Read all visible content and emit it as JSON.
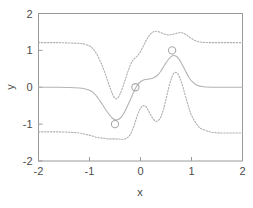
{
  "chart_data": {
    "type": "line",
    "title": "",
    "subtitle": "",
    "xlabel": "x",
    "ylabel": "y",
    "xlim": [
      -2,
      2
    ],
    "ylim": [
      -2,
      2
    ],
    "xticks": [
      -2,
      -1,
      0,
      1,
      2
    ],
    "yticks": [
      -2,
      -1,
      0,
      1,
      2
    ],
    "xtick_labels": [
      "-2",
      "-1",
      "0",
      "1",
      "2"
    ],
    "ytick_labels": [
      "-2",
      "-1",
      "0",
      "1",
      "2"
    ],
    "grid": false,
    "legend": "none",
    "colors": {
      "mean": "#b4b4b4",
      "band": "#b0b0b0",
      "marker": "#a8a8a8",
      "frame": "#9a9a9a",
      "text": "#4d4d4d",
      "background": "#ffffff"
    },
    "observations": {
      "name": "observed data points",
      "marker": "open-circle",
      "x": [
        -0.5,
        -0.1,
        0.62
      ],
      "y": [
        -1.0,
        0.0,
        1.0
      ]
    },
    "series": [
      {
        "name": "predictive mean",
        "style": "solid",
        "x": [
          -2.0,
          -1.8,
          -1.6,
          -1.4,
          -1.2,
          -1.1,
          -1.0,
          -0.95,
          -0.9,
          -0.85,
          -0.8,
          -0.75,
          -0.7,
          -0.65,
          -0.6,
          -0.55,
          -0.5,
          -0.45,
          -0.4,
          -0.35,
          -0.3,
          -0.25,
          -0.2,
          -0.15,
          -0.1,
          -0.05,
          0.0,
          0.05,
          0.1,
          0.15,
          0.2,
          0.25,
          0.3,
          0.35,
          0.4,
          0.45,
          0.5,
          0.55,
          0.6,
          0.65,
          0.7,
          0.75,
          0.8,
          0.85,
          0.9,
          0.95,
          1.0,
          1.1,
          1.2,
          1.4,
          1.6,
          1.8,
          2.0
        ],
        "y": [
          0.0,
          0.0,
          0.0,
          -0.005,
          -0.02,
          -0.04,
          -0.08,
          -0.12,
          -0.18,
          -0.26,
          -0.36,
          -0.46,
          -0.57,
          -0.67,
          -0.76,
          -0.84,
          -0.88,
          -0.88,
          -0.84,
          -0.76,
          -0.64,
          -0.49,
          -0.34,
          -0.18,
          -0.03,
          0.08,
          0.15,
          0.19,
          0.21,
          0.22,
          0.23,
          0.25,
          0.29,
          0.35,
          0.44,
          0.55,
          0.66,
          0.76,
          0.83,
          0.86,
          0.84,
          0.77,
          0.66,
          0.53,
          0.39,
          0.27,
          0.17,
          0.06,
          0.02,
          0.0,
          0.0,
          0.0,
          0.0
        ]
      },
      {
        "name": "upper confidence band",
        "style": "dotted",
        "x": [
          -2.0,
          -1.8,
          -1.6,
          -1.4,
          -1.2,
          -1.1,
          -1.0,
          -0.95,
          -0.9,
          -0.85,
          -0.8,
          -0.75,
          -0.7,
          -0.65,
          -0.6,
          -0.55,
          -0.5,
          -0.45,
          -0.4,
          -0.35,
          -0.3,
          -0.25,
          -0.2,
          -0.15,
          -0.1,
          -0.05,
          0.0,
          0.05,
          0.1,
          0.15,
          0.2,
          0.25,
          0.3,
          0.35,
          0.4,
          0.45,
          0.5,
          0.55,
          0.6,
          0.65,
          0.7,
          0.75,
          0.8,
          0.85,
          0.9,
          0.95,
          1.0,
          1.1,
          1.2,
          1.4,
          1.6,
          1.8,
          2.0
        ],
        "y": [
          1.21,
          1.21,
          1.21,
          1.2,
          1.19,
          1.17,
          1.12,
          1.07,
          0.99,
          0.88,
          0.74,
          0.58,
          0.4,
          0.2,
          0.0,
          -0.18,
          -0.3,
          -0.3,
          -0.18,
          0.0,
          0.2,
          0.41,
          0.6,
          0.73,
          0.8,
          0.87,
          0.97,
          1.1,
          1.24,
          1.36,
          1.45,
          1.5,
          1.52,
          1.51,
          1.48,
          1.45,
          1.43,
          1.42,
          1.43,
          1.44,
          1.46,
          1.48,
          1.48,
          1.46,
          1.42,
          1.37,
          1.32,
          1.25,
          1.22,
          1.21,
          1.21,
          1.21,
          1.21
        ]
      },
      {
        "name": "lower confidence band",
        "style": "dotted",
        "x": [
          -2.0,
          -1.8,
          -1.6,
          -1.4,
          -1.2,
          -1.1,
          -1.0,
          -0.95,
          -0.9,
          -0.85,
          -0.8,
          -0.75,
          -0.7,
          -0.65,
          -0.6,
          -0.55,
          -0.5,
          -0.45,
          -0.4,
          -0.35,
          -0.3,
          -0.25,
          -0.2,
          -0.15,
          -0.1,
          -0.05,
          0.0,
          0.05,
          0.1,
          0.15,
          0.2,
          0.25,
          0.3,
          0.35,
          0.4,
          0.45,
          0.5,
          0.55,
          0.6,
          0.65,
          0.7,
          0.75,
          0.8,
          0.85,
          0.9,
          0.95,
          1.0,
          1.1,
          1.2,
          1.4,
          1.6,
          1.8,
          2.0
        ],
        "y": [
          -1.21,
          -1.21,
          -1.21,
          -1.22,
          -1.24,
          -1.27,
          -1.3,
          -1.32,
          -1.34,
          -1.36,
          -1.37,
          -1.38,
          -1.39,
          -1.4,
          -1.4,
          -1.4,
          -1.4,
          -1.4,
          -1.41,
          -1.41,
          -1.4,
          -1.36,
          -1.28,
          -1.13,
          -0.93,
          -0.72,
          -0.57,
          -0.5,
          -0.52,
          -0.62,
          -0.75,
          -0.86,
          -0.92,
          -0.9,
          -0.8,
          -0.6,
          -0.33,
          -0.03,
          0.21,
          0.37,
          0.4,
          0.32,
          0.15,
          -0.08,
          -0.33,
          -0.56,
          -0.76,
          -1.0,
          -1.13,
          -1.22,
          -1.24,
          -1.24,
          -1.24
        ]
      }
    ]
  },
  "axes": {
    "x_title": "x",
    "y_title": "y"
  }
}
